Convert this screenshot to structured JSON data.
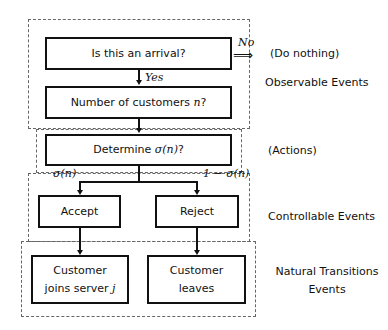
{
  "diagram": {
    "nodes": {
      "arrival": {
        "text": "Is this an arrival?"
      },
      "customers": {
        "text": "Number of customers ",
        "var": "n",
        "suffix": "?"
      },
      "determine": {
        "text": "Determine ",
        "var": "σ(n)",
        "suffix": "?"
      },
      "accept": {
        "text": "Accept"
      },
      "reject": {
        "text": "Reject"
      },
      "joins": {
        "line1": "Customer",
        "line2": "joins server ",
        "var": "j"
      },
      "leaves": {
        "line1": "Customer",
        "line2": "leaves"
      }
    },
    "edge_labels": {
      "no": "No",
      "yes": "Yes",
      "sigma": "σ(n)",
      "one_minus_sigma": "1 − σ(n)"
    },
    "side_labels": {
      "do_nothing": "(Do nothing)",
      "observable": "Observable Events",
      "actions": "(Actions)",
      "controllable": "Controllable Events",
      "natural_line1": "Natural Transitions",
      "natural_line2": "Events"
    }
  }
}
